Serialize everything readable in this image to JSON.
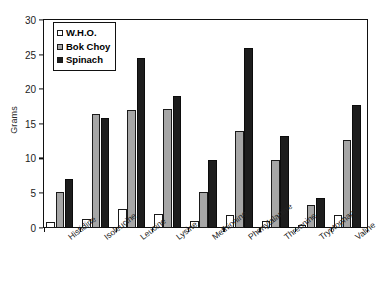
{
  "chart_data": {
    "type": "bar",
    "title": "",
    "xlabel": "",
    "ylabel": "Grams",
    "ylim": [
      0,
      30
    ],
    "yticks": [
      0,
      5,
      10,
      15,
      20,
      25,
      30
    ],
    "grid": false,
    "legend_position": "top-left",
    "categories": [
      "Histidine",
      "Isoleucine",
      "Leucine",
      "Lysine",
      "Methionine",
      "Phenylalanine",
      "Threonine",
      "Tryptophan",
      "Valine"
    ],
    "series": [
      {
        "name": "W.H.O.",
        "color": "#ffffff",
        "values": [
          0.8,
          1.3,
          2.7,
          2.0,
          1.0,
          1.8,
          1.0,
          0.4,
          1.8
        ]
      },
      {
        "name": "Bok Choy",
        "color": "#a6a6a6",
        "values": [
          5.1,
          16.4,
          17.0,
          17.2,
          5.1,
          14.0,
          9.7,
          3.2,
          12.7
        ]
      },
      {
        "name": "Spinach",
        "color": "#1d1d1d",
        "values": [
          7.0,
          15.9,
          24.5,
          19.0,
          9.7,
          26.0,
          13.3,
          4.3,
          17.7
        ]
      }
    ]
  },
  "legend": {
    "items": [
      {
        "label": "W.H.O."
      },
      {
        "label": "Bok Choy"
      },
      {
        "label": "Spinach"
      }
    ]
  },
  "axis": {
    "y_title": "Grams"
  }
}
